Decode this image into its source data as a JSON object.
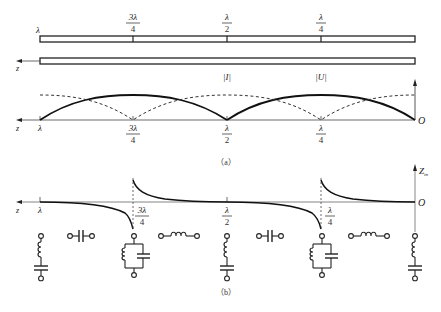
{
  "figure": {
    "panel_a": {
      "caption": "（a）",
      "transmission_line": {
        "position_labels": [
          {
            "num": "",
            "den": "",
            "text": "λ"
          },
          {
            "num": "3λ",
            "den": "4"
          },
          {
            "num": "λ",
            "den": "2"
          },
          {
            "num": "λ",
            "den": "4"
          }
        ],
        "axis_label": "z"
      },
      "plot": {
        "axis_label_z": "z",
        "origin_label": "O",
        "x_labels": [
          {
            "text": "λ"
          },
          {
            "num": "3λ",
            "den": "4"
          },
          {
            "num": "λ",
            "den": "2"
          },
          {
            "num": "λ",
            "den": "4"
          }
        ],
        "curve_labels": {
          "current": "|I|",
          "voltage": "|U|"
        }
      }
    },
    "panel_b": {
      "caption": "（b）",
      "y_axis_label": "Z",
      "y_axis_subscript": "in",
      "axis_label_z": "z",
      "origin_label": "O",
      "x_labels": [
        {
          "text": "λ"
        },
        {
          "num": "3λ",
          "den": "4"
        },
        {
          "num": "λ",
          "den": "2"
        },
        {
          "num": "λ",
          "den": "4"
        }
      ],
      "equivalent_circuits": [
        "series-LC-short",
        "capacitor",
        "parallel-LC-open",
        "inductor",
        "series-LC-short",
        "capacitor",
        "parallel-LC-open",
        "inductor",
        "series-LC-short"
      ]
    }
  }
}
